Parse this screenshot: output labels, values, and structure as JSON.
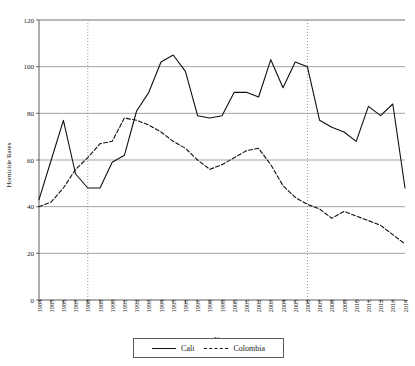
{
  "chart_data": {
    "type": "line",
    "title": "",
    "xlabel": "Years",
    "ylabel": "Homicide Rates",
    "ylim": [
      0,
      120
    ],
    "ytick_step": 20,
    "yticks": [
      0,
      20,
      40,
      60,
      80,
      100,
      120
    ],
    "grid": "horizontal",
    "legend_position": "bottom",
    "categories": [
      "1984",
      "1985",
      "1986",
      "1987",
      "1988",
      "1989",
      "1990",
      "1991",
      "1992",
      "1993",
      "1994",
      "1995",
      "1996",
      "1997",
      "1998",
      "1999",
      "2000",
      "2001",
      "2002",
      "2003",
      "2004",
      "2005",
      "2006",
      "2007",
      "2008",
      "2009",
      "2010",
      "2011",
      "2012",
      "2013",
      "2014"
    ],
    "series": [
      {
        "name": "Cali",
        "style": "solid",
        "color": "#101010",
        "values": [
          43,
          60,
          77,
          54,
          48,
          48,
          59,
          62,
          81,
          89,
          102,
          105,
          98,
          79,
          78,
          79,
          89,
          89,
          87,
          103,
          91,
          102,
          100,
          77,
          74,
          72,
          68,
          83,
          79,
          84,
          48
        ]
      },
      {
        "name": "Colombia",
        "style": "dashed",
        "color": "#101010",
        "values": [
          40,
          42,
          48,
          56,
          61,
          67,
          68,
          78,
          77,
          75,
          72,
          68,
          65,
          60,
          56,
          58,
          61,
          64,
          65,
          58,
          49,
          44,
          41,
          39,
          35,
          38,
          36,
          34,
          32,
          28,
          24
        ]
      }
    ],
    "annotations": [
      {
        "name": "event-line-1988",
        "type": "vertical-dotted",
        "x": "1988"
      },
      {
        "name": "event-line-2006",
        "type": "vertical-dotted",
        "x": "2006"
      }
    ]
  },
  "legend": {
    "items": [
      {
        "label": "Cali",
        "style": "solid"
      },
      {
        "label": "Colombia",
        "style": "dashed"
      }
    ]
  }
}
